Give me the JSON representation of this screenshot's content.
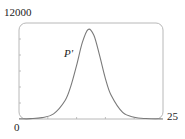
{
  "chart_data": {
    "type": "line",
    "title": "",
    "xlabel": "",
    "ylabel": "",
    "xlim": [
      0,
      25
    ],
    "ylim": [
      0,
      12000
    ],
    "x_tick_labels": [
      "0",
      "25"
    ],
    "y_tick_labels": [
      "0",
      "12000"
    ],
    "x_minor_ticks": [
      5,
      10,
      15,
      20
    ],
    "y_minor_ticks": [
      2000,
      4000,
      6000,
      8000,
      10000
    ],
    "grid": false,
    "legend": null,
    "annotations": [
      {
        "text": "P'",
        "x": 9.2,
        "y": 8000
      }
    ],
    "series": [
      {
        "name": "P'",
        "x": [
          0,
          2,
          4,
          6,
          8,
          9,
          10,
          11,
          12,
          13,
          14,
          15,
          16,
          18,
          20,
          22,
          25
        ],
        "values": [
          11,
          44,
          169,
          638,
          2305,
          4115,
          6712,
          9572,
          11198,
          10464,
          7917,
          5059,
          2958,
          821,
          221,
          57,
          7
        ]
      }
    ]
  },
  "labels": {
    "ymax": "12000",
    "xmin": "0",
    "xmax": "25",
    "curve": "P'"
  },
  "style": {
    "frame_color": "#b8b8b8",
    "curve_color": "#7a7a7a",
    "tick_color": "#b0b0b0"
  }
}
